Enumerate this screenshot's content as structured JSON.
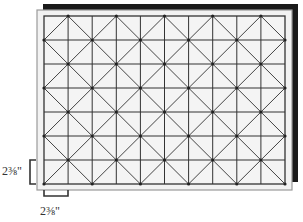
{
  "diagram": {
    "type": "quilt-grid",
    "columns": 10,
    "rows": 7,
    "cell_size_label": "2⅜\"",
    "pattern": "diamond lattice (diagonals through alternating grid intersections)",
    "colors": {
      "board_fill": "#f2f2f2",
      "board_border": "#9a9a9a",
      "shadow": "#1a1a1a",
      "grid_line": "#333333",
      "diagonal_line": "#444444",
      "bracket": "#333333"
    }
  },
  "dimensions": {
    "vertical_label": "2⅜\"",
    "horizontal_label": "2⅜\""
  }
}
